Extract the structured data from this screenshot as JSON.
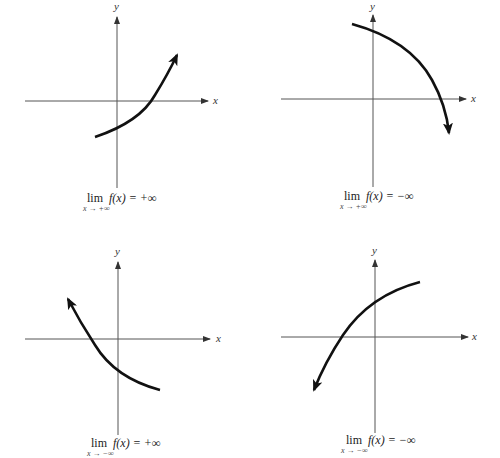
{
  "figure": {
    "panels": [
      {
        "id": "top-left",
        "axis_x_label": "x",
        "axis_y_label": "y",
        "limit_word": "lim",
        "limit_sub": "x → +∞",
        "limit_expr": "f(x) = +∞",
        "curve_direction": "increasing, arrow toward upper right"
      },
      {
        "id": "top-right",
        "axis_x_label": "x",
        "axis_y_label": "y",
        "limit_word": "lim",
        "limit_sub": "x → +∞",
        "limit_expr": "f(x) = −∞",
        "curve_direction": "decreasing, arrow toward lower right"
      },
      {
        "id": "bottom-left",
        "axis_x_label": "x",
        "axis_y_label": "y",
        "limit_word": "lim",
        "limit_sub": "x → −∞",
        "limit_expr": "f(x) = +∞",
        "curve_direction": "arrow toward upper left"
      },
      {
        "id": "bottom-right",
        "axis_x_label": "x",
        "axis_y_label": "y",
        "limit_word": "lim",
        "limit_sub": "x → −∞",
        "limit_expr": "f(x) = −∞",
        "curve_direction": "arrow toward lower left"
      }
    ],
    "colors": {
      "axis": "#555555",
      "curve": "#111111",
      "background": "#ffffff"
    }
  }
}
